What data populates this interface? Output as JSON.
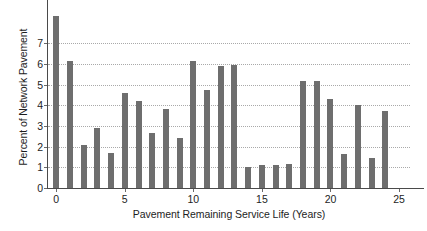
{
  "chart_data": {
    "type": "bar",
    "title": "",
    "xlabel": "Pavement Remaining Service Life (Years)",
    "ylabel": "Percent of Network Pavement",
    "categories": [
      0,
      1,
      2,
      3,
      4,
      5,
      6,
      7,
      8,
      9,
      10,
      11,
      12,
      13,
      14,
      15,
      16,
      17,
      18,
      19,
      20,
      21,
      22,
      23,
      24
    ],
    "values": [
      8.3,
      6.15,
      2.1,
      2.9,
      1.7,
      4.6,
      4.2,
      2.65,
      3.8,
      2.4,
      6.15,
      4.75,
      5.9,
      5.95,
      1.0,
      1.1,
      1.1,
      1.15,
      5.15,
      5.15,
      4.3,
      1.65,
      4.0,
      1.45,
      3.7
    ],
    "xlim": [
      -0.6,
      25.8
    ],
    "ylim": [
      0,
      8.7
    ],
    "xticks": [
      0,
      5,
      10,
      15,
      20,
      25
    ],
    "xtick_labels": [
      "0",
      "5",
      "10",
      "15",
      "20",
      "25"
    ],
    "yticks": [
      0,
      1,
      2,
      3,
      4,
      5,
      6,
      7
    ],
    "ytick_labels": [
      "0",
      "1",
      "2",
      "3",
      "4",
      "5",
      "6",
      "7"
    ],
    "grid": "horizontal-dotted",
    "legend": "none",
    "bar_color": "#6e6e6e",
    "axis_color": "#4a4a4a",
    "grid_color": "#a9a9a9",
    "background": "#ffffff"
  }
}
